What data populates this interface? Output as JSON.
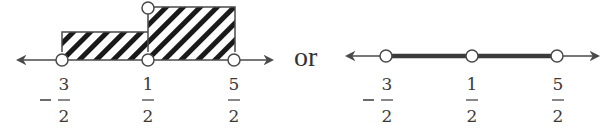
{
  "figure": {
    "connector": "or",
    "number_line_left": {
      "description": "Number line with hatched bar graph regions",
      "points": [
        {
          "num": "3",
          "den": "2",
          "sign": "-",
          "open": true
        },
        {
          "num": "1",
          "den": "2",
          "sign": "",
          "open": true
        },
        {
          "num": "5",
          "den": "2",
          "sign": "",
          "open": true
        }
      ],
      "regions": [
        {
          "from": "-3/2",
          "to": "1/2",
          "style": "hatched",
          "height": "short"
        },
        {
          "from": "1/2",
          "to": "5/2",
          "style": "hatched",
          "height": "tall",
          "top_open_circle": true
        }
      ]
    },
    "number_line_right": {
      "description": "Number line with shaded interval and open points",
      "points": [
        {
          "num": "3",
          "den": "2",
          "sign": "-",
          "open": true
        },
        {
          "num": "1",
          "den": "2",
          "sign": "",
          "open": true
        },
        {
          "num": "5",
          "den": "2",
          "sign": "",
          "open": true
        }
      ],
      "shaded_from": "-3/2",
      "shaded_to": "5/2"
    }
  },
  "colors": {
    "line": "#4a4a4a",
    "hatch": "#1a1a1a",
    "bold": "#3a3a3a"
  }
}
